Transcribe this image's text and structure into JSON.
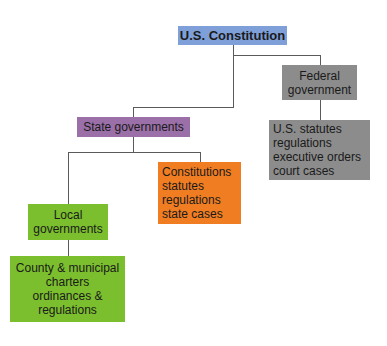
{
  "diagram": {
    "type": "hierarchy",
    "colors": {
      "constitution": "#7f9fd9",
      "federal": "#8c8c8c",
      "state": "#9b6fa8",
      "state_sources": "#f07d22",
      "local": "#7bbf2e"
    },
    "nodes": {
      "constitution": {
        "label": "U.S. Constitution"
      },
      "federal": {
        "lines": [
          "Federal",
          "government"
        ]
      },
      "federal_sources": {
        "lines": [
          "U.S. statutes",
          "regulations",
          "executive orders",
          "court cases"
        ]
      },
      "state": {
        "label": "State governments"
      },
      "state_sources": {
        "lines": [
          "Constitutions",
          "statutes",
          "regulations",
          "state cases"
        ]
      },
      "local": {
        "lines": [
          "Local",
          "governments"
        ]
      },
      "local_sources": {
        "lines": [
          "County & municipal",
          "charters",
          "ordinances &",
          "regulations"
        ]
      }
    }
  }
}
